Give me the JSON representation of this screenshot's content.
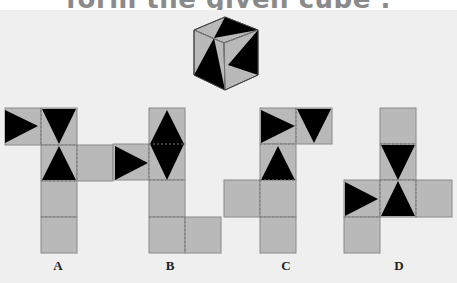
{
  "question": {
    "title_fragment": "form the given cube :"
  },
  "colors": {
    "face_fill": "#b9b9b9",
    "triangle_fill": "#000000",
    "border": "#8a8a8a",
    "panel_bg": "#efefef",
    "title_color": "#8a8a8a"
  },
  "cube": {
    "description": "isometric cube with black/grey triangular patterns on three visible faces"
  },
  "options": [
    {
      "label": "A"
    },
    {
      "label": "B"
    },
    {
      "label": "C"
    },
    {
      "label": "D"
    }
  ]
}
